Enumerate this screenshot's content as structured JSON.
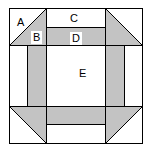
{
  "figure": {
    "colors": {
      "shaded_fill": "#c3c3c3",
      "plain_fill": "#ffffff",
      "outline": "#000000",
      "background": "#ffffff"
    },
    "geometry": {
      "outer_square": {
        "x": 9,
        "y": 8,
        "width": 134,
        "height": 136
      },
      "band_inset": 19,
      "corner_size": 37
    },
    "labels": [
      {
        "id": "A",
        "text": "A",
        "region": "plain-corner-triangle",
        "boxed": false
      },
      {
        "id": "B",
        "text": "B",
        "region": "shaded-corner-triangle",
        "boxed": true
      },
      {
        "id": "C",
        "text": "C",
        "region": "plain-top-band",
        "boxed": false
      },
      {
        "id": "D",
        "text": "D",
        "region": "shaded-top-band",
        "boxed": true
      },
      {
        "id": "E",
        "text": "E",
        "region": "plain-center-square",
        "boxed": false
      }
    ]
  }
}
